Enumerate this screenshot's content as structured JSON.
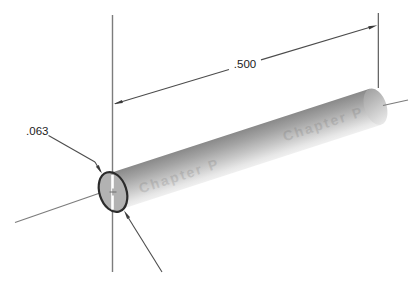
{
  "dimensions": {
    "length": {
      "label": ".500"
    },
    "diameter": {
      "label": ".063"
    }
  },
  "watermark": {
    "text": "Chapter P"
  },
  "colors": {
    "background": "#ffffff",
    "dimension_line": "#4c4c4c",
    "axis_line": "#7c7c7c",
    "text": "#1b1b1b",
    "cylinder_dark": "#8c8c8c",
    "cylinder_mid": "#b8b8b8",
    "cylinder_light": "#ececec",
    "end_face_fill": "#b2b2b2",
    "end_face_outline": "#2b2b2b",
    "highlight_stripe": "#ffffff"
  }
}
